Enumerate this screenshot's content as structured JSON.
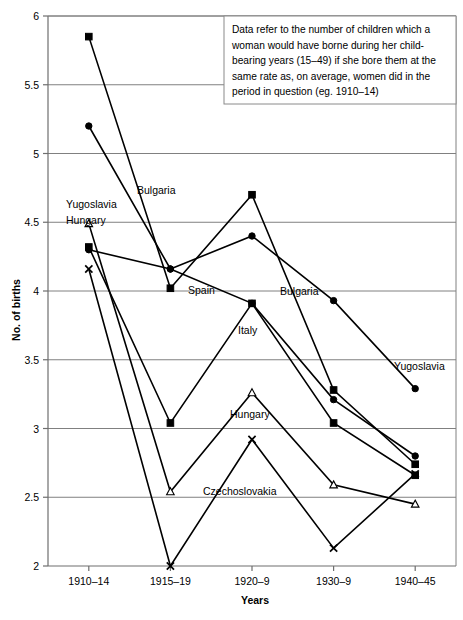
{
  "chart_data": {
    "type": "line",
    "title": "",
    "xlabel": "Years",
    "ylabel": "No. of births",
    "categories": [
      "1910–14",
      "1915–19",
      "1920–9",
      "1930–9",
      "1940–45"
    ],
    "ylim": [
      2,
      6
    ],
    "yticks": [
      2,
      2.5,
      3,
      3.5,
      4,
      4.5,
      5,
      5.5,
      6
    ],
    "ytick_labels": [
      "2",
      "2.5",
      "3",
      "3.5",
      "4",
      "4.5",
      "5",
      "5.5",
      "6"
    ],
    "grid": "horizontal",
    "legend": "inline-labels",
    "annotation": "Data refer to the number of children which a woman would have borne during her child-bearing years (15–49) if she bore them at the same rate as, on average, women did in the period in question (eg. 1910–14)",
    "series": [
      {
        "name": "Bulgaria",
        "marker": "square-filled",
        "label_positions": [
          "top-left",
          "mid-right"
        ],
        "values": [
          5.85,
          4.02,
          4.7,
          3.28,
          2.74
        ]
      },
      {
        "name": "Yugoslavia",
        "marker": "circle-filled",
        "label_positions": [
          "top-left",
          "right"
        ],
        "values": [
          5.2,
          4.16,
          4.4,
          3.93,
          3.29
        ]
      },
      {
        "name": "Spain",
        "marker": "circle-filled",
        "label_positions": [
          "mid-left"
        ],
        "values": [
          4.3,
          4.16,
          3.91,
          3.21,
          2.8
        ]
      },
      {
        "name": "Italy",
        "marker": "square-filled",
        "label_positions": [
          "mid-center"
        ],
        "values": [
          4.32,
          3.04,
          3.91,
          3.04,
          2.66
        ]
      },
      {
        "name": "Hungary",
        "marker": "triangle-open",
        "label_positions": [
          "top-left",
          "mid-center"
        ],
        "values": [
          4.49,
          2.54,
          3.26,
          2.59,
          2.45
        ]
      },
      {
        "name": "Czechoslovakia",
        "marker": "x",
        "label_positions": [
          "mid-center"
        ],
        "values": [
          4.16,
          2.0,
          2.92,
          2.13,
          2.67
        ]
      }
    ],
    "inline_labels": [
      {
        "text": "Yugoslavia",
        "x": 66,
        "y": 208
      },
      {
        "text": "Hungary",
        "x": 66,
        "y": 224
      },
      {
        "text": "Bulgaria",
        "x": 137,
        "y": 194
      },
      {
        "text": "Spain",
        "x": 188,
        "y": 294
      },
      {
        "text": "Bulgaria",
        "x": 280,
        "y": 295
      },
      {
        "text": "Italy",
        "x": 238,
        "y": 334
      },
      {
        "text": "Hungary",
        "x": 230,
        "y": 418
      },
      {
        "text": "Czechoslovakia",
        "x": 203,
        "y": 495
      },
      {
        "text": "Yugoslavia",
        "x": 394,
        "y": 370
      }
    ]
  }
}
